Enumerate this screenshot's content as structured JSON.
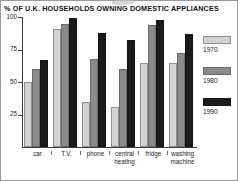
{
  "chart_data": {
    "type": "bar",
    "title": "% OF U.K. HOUSEHOLDS OWNING DOMESTIC APPLIANCES",
    "xlabel": "",
    "ylabel": "",
    "ylim": [
      0,
      100
    ],
    "yticks": [
      25,
      50,
      75,
      100
    ],
    "ytick_labels": [
      "25",
      "50",
      "75",
      "100"
    ],
    "grid": false,
    "legend_position": "right",
    "categories": [
      "car",
      "T.V.",
      "phone",
      "central heating",
      "fridge",
      "washing machine"
    ],
    "category_labels": [
      "car",
      "T.V.",
      "phone",
      "central\nheating",
      "fridge",
      "washing\nmachine"
    ],
    "series": [
      {
        "name": "1970",
        "color": "#d2d2d2",
        "values": [
          50,
          91,
          35,
          31,
          65,
          65
        ]
      },
      {
        "name": "1980",
        "color": "#8a8a8a",
        "values": [
          60,
          95,
          68,
          60,
          94,
          72
        ]
      },
      {
        "name": "1990",
        "color": "#1b1b1b",
        "values": [
          67,
          99,
          88,
          82,
          98,
          87
        ]
      }
    ]
  },
  "legend": {
    "entries": [
      {
        "label": "1970"
      },
      {
        "label": "1980"
      },
      {
        "label": "1990"
      }
    ]
  },
  "colors": {
    "y1970": "#d2d2d2",
    "y1980": "#8a8a8a",
    "y1990": "#1b1b1b",
    "axis": "#3b3b3b",
    "frame": "#9a9a9a",
    "text": "#1a1a1a"
  }
}
